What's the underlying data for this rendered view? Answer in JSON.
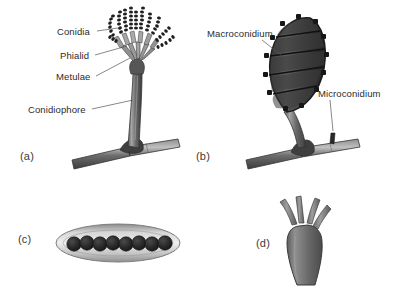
{
  "figure": {
    "background_color": "#ffffff",
    "ink_color": "#2b2b2b"
  },
  "palette": {
    "hypha_dark": "#4a4a4a",
    "hypha_mid": "#6e6e6e",
    "hypha_light": "#a8a8a8",
    "spore_dark": "#262626",
    "ascus_fill": "#bdbdbd",
    "ascus_edge": "#7d7d7d",
    "basidium_fill": "#6b6b6b",
    "leader_line": "#555555"
  },
  "panels": [
    {
      "id": "a",
      "letter": "(a)",
      "subject": "conidiophore",
      "labels": [
        {
          "text": "Conidia",
          "x": 57,
          "y": 33
        },
        {
          "text": "Phialid",
          "x": 60,
          "y": 57
        },
        {
          "text": "Metulae",
          "x": 56,
          "y": 78
        },
        {
          "text": "Conidiophore",
          "x": 28,
          "y": 112
        }
      ],
      "conidia_chains": 11,
      "conidia_per_chain": 8
    },
    {
      "id": "b",
      "letter": "(b)",
      "subject": "macroconidium and microconidium",
      "labels": [
        {
          "text": "Macroconidium",
          "x": 207,
          "y": 35
        },
        {
          "text": "Microconidium",
          "x": 318,
          "y": 95
        }
      ],
      "macroconidium_septa": 4,
      "macroconidium_compartments": 5,
      "microconidium_count": 1
    },
    {
      "id": "c",
      "letter": "(c)",
      "subject": "ascus with ascospores",
      "labels": [],
      "ascospore_count": 8
    },
    {
      "id": "d",
      "letter": "(d)",
      "subject": "basidium with sterigmata",
      "labels": [],
      "sterigmata_count": 4
    }
  ],
  "panel_letters": {
    "a": {
      "text": "(a)",
      "x": 20,
      "y": 150
    },
    "b": {
      "text": "(b)",
      "x": 196,
      "y": 150
    },
    "c": {
      "text": "(c)",
      "x": 18,
      "y": 233
    },
    "d": {
      "text": "(d)",
      "x": 256,
      "y": 237
    }
  }
}
